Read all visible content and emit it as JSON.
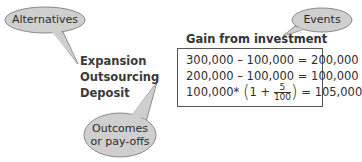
{
  "callouts": {
    "alternatives": "Alternatives",
    "events": "Events",
    "outcomes_line1": "Outcomes",
    "outcomes_line2": "or pay-offs"
  },
  "header": "Gain from investment",
  "alternatives": [
    {
      "label": "Expansion",
      "formula": "300,000 – 100,000 = 200,000"
    },
    {
      "label": "Outsourcing",
      "formula": "200,000 – 100,000 = 100,000"
    },
    {
      "label": "Deposit",
      "formula_prefix": "100,000*",
      "one_plus": "1 +",
      "frac_num": "5",
      "frac_den": "100",
      "formula_suffix": "= 105,000"
    }
  ],
  "colors": {
    "bubble_fill": "#cfcfcf",
    "bubble_stroke": "#8a8a8a",
    "box_border": "#555555",
    "text": "#2e2e2e"
  }
}
